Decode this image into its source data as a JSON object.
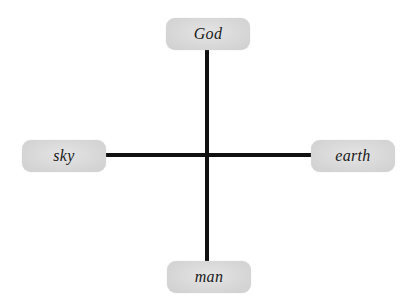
{
  "diagram": {
    "type": "cross",
    "colors": {
      "line": "#111111",
      "node_fill": "#d9d9d9",
      "text": "#1a1a1a",
      "background": "#ffffff"
    },
    "nodes": {
      "top": {
        "label": "God"
      },
      "left": {
        "label": "sky"
      },
      "right": {
        "label": "earth"
      },
      "bottom": {
        "label": "man"
      }
    },
    "edges": [
      {
        "from": "top",
        "to": "bottom",
        "orientation": "vertical"
      },
      {
        "from": "left",
        "to": "right",
        "orientation": "horizontal"
      }
    ]
  }
}
